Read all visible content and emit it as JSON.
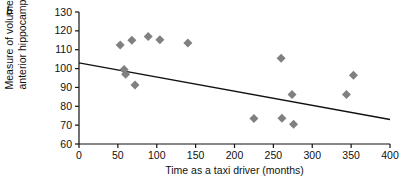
{
  "panel": {
    "label": "b"
  },
  "chart_data": {
    "type": "scatter",
    "title": "",
    "xlabel": "Time as a taxi driver (months)",
    "ylabel": "Measure of volume of anterior hippocampus",
    "ylabel_line1": "Measure of volume of",
    "ylabel_line2": "anterior hippocampus",
    "xlim": [
      0,
      400
    ],
    "ylim": [
      60,
      130
    ],
    "xticks": [
      0,
      50,
      100,
      150,
      200,
      250,
      300,
      350,
      400
    ],
    "yticks": [
      60,
      70,
      80,
      90,
      100,
      110,
      120,
      130
    ],
    "xtick_labels": [
      "0",
      "50",
      "100",
      "150",
      "200",
      "250",
      "300",
      "350",
      "400"
    ],
    "ytick_labels": [
      "60",
      "70",
      "80",
      "90",
      "100",
      "110",
      "120",
      "130"
    ],
    "grid": false,
    "legend": false,
    "marker": "diamond",
    "marker_color": "#808080",
    "marker_size": 9,
    "points": [
      {
        "x": 53,
        "y": 112.5
      },
      {
        "x": 58,
        "y": 99.5
      },
      {
        "x": 60,
        "y": 97.0
      },
      {
        "x": 68,
        "y": 115.0
      },
      {
        "x": 72,
        "y": 91.3
      },
      {
        "x": 89,
        "y": 117.0
      },
      {
        "x": 104,
        "y": 115.3
      },
      {
        "x": 140,
        "y": 113.5
      },
      {
        "x": 225,
        "y": 73.5
      },
      {
        "x": 260,
        "y": 105.5
      },
      {
        "x": 261,
        "y": 73.7
      },
      {
        "x": 274,
        "y": 86.3
      },
      {
        "x": 276,
        "y": 70.5
      },
      {
        "x": 344,
        "y": 86.3
      },
      {
        "x": 353,
        "y": 96.5
      }
    ],
    "trendline": {
      "type": "line",
      "color": "#111111",
      "x": [
        0,
        400
      ],
      "y": [
        103,
        73
      ]
    }
  }
}
